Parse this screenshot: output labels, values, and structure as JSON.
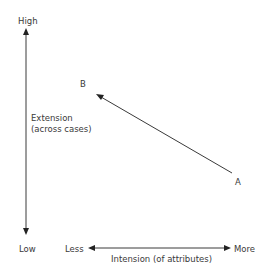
{
  "diagram": {
    "y_axis": {
      "top_label": "High",
      "bottom_label": "Low",
      "title_line1": "Extension",
      "title_line2": "(across cases)"
    },
    "x_axis": {
      "left_label": "Less",
      "right_label": "More",
      "title": "Intension (of attributes)"
    },
    "points": {
      "a_label": "A",
      "b_label": "B"
    },
    "colors": {
      "line": "#3a3a3a",
      "text": "#3a3a3a",
      "background": "#ffffff"
    }
  }
}
